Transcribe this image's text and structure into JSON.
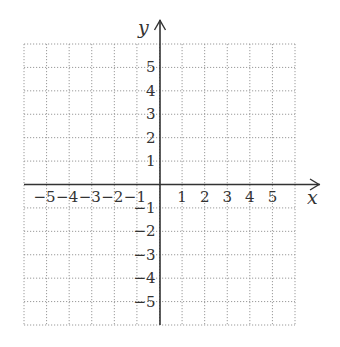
{
  "chart_data": {
    "type": "coordinate-plane",
    "title": "",
    "xlabel": "x",
    "ylabel": "y",
    "xlim": [
      -6,
      6
    ],
    "ylim": [
      -6,
      6
    ],
    "grid": true,
    "grid_style": "dotted",
    "x_tick_labels": [
      "-5",
      "-4",
      "-3",
      "-2",
      "-1",
      "1",
      "2",
      "3",
      "4",
      "5"
    ],
    "y_tick_labels": [
      "5",
      "4",
      "3",
      "2",
      "1",
      "-1",
      "-2",
      "-3",
      "-4",
      "-5"
    ],
    "x_ticks": [
      -5,
      -4,
      -3,
      -2,
      -1,
      1,
      2,
      3,
      4,
      5
    ],
    "y_ticks": [
      5,
      4,
      3,
      2,
      1,
      -1,
      -2,
      -3,
      -4,
      -5
    ]
  },
  "labels": {
    "x_axis": "x",
    "y_axis": "y"
  },
  "colors": {
    "axis": "#333333",
    "grid": "#9a9a9a",
    "text": "#333333",
    "background": "#ffffff"
  }
}
